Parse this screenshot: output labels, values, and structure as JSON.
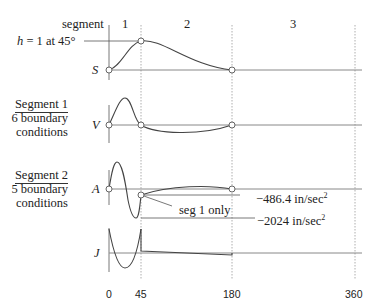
{
  "header": {
    "segment_label": "segment",
    "segments": [
      "1",
      "2",
      "3"
    ]
  },
  "annotations": {
    "h_label": "h = 1 at 45°",
    "seg1_only": "seg 1 only",
    "accel_a": "−486.4  in/sec",
    "accel_b": "−2024  in/sec",
    "sup": "2"
  },
  "side_notes": [
    {
      "title": "Segment 1",
      "line1": "6 boundary",
      "line2": "conditions"
    },
    {
      "title": "Segment 2",
      "line1": "5 boundary",
      "line2": "conditions"
    }
  ],
  "curves": [
    {
      "id": "S",
      "label": "S"
    },
    {
      "id": "V",
      "label": "V"
    },
    {
      "id": "A",
      "label": "A"
    },
    {
      "id": "J",
      "label": "J"
    }
  ],
  "x_axis": {
    "ticks": [
      "0",
      "45",
      "180",
      "360"
    ]
  },
  "colors": {
    "curve": "#444444",
    "axis": "#888888",
    "dotted": "#999999"
  }
}
